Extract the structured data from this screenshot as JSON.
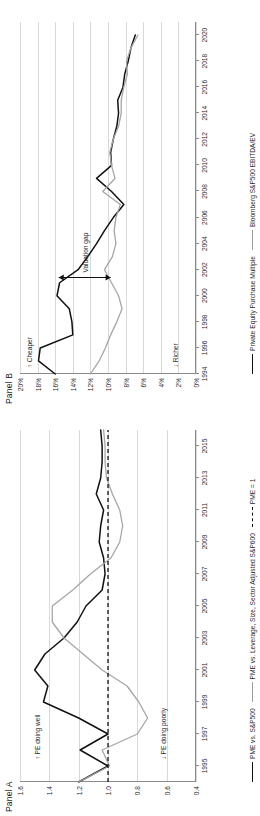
{
  "figure": {
    "orientation_degrees": -90,
    "background": "#ffffff"
  },
  "panels": [
    {
      "id": "A",
      "title": "Panel A",
      "notes": [
        {
          "name": "pe-doing-well",
          "text": "↑ PE doing well"
        },
        {
          "name": "pe-doing-poorly",
          "text": "↓ PE doing poorly"
        }
      ],
      "legend": [
        {
          "label": "PME vs. S&P500",
          "style": "solid-dark",
          "color": "#111111"
        },
        {
          "label": "PME vs. Leverage, Size, Sector Adjusted S&P600",
          "style": "solid-grey",
          "color": "#a6a6a6"
        },
        {
          "label": "PME = 1",
          "style": "dashed",
          "color": "#111111"
        }
      ],
      "chart_data": {
        "type": "line",
        "title": "Panel A",
        "xlabel": "",
        "ylabel": "",
        "xlim": [
          1994,
          2016
        ],
        "ylim": [
          0.4,
          1.6
        ],
        "yticks": [
          "0.4",
          "0.6",
          "0.8",
          "1.0",
          "1.2",
          "1.4",
          "1.6"
        ],
        "ytick_values": [
          0.4,
          0.6,
          0.8,
          1.0,
          1.2,
          1.4,
          1.6
        ],
        "xticks": [
          "1995",
          "1997",
          "1999",
          "2001",
          "2003",
          "2005",
          "2007",
          "2009",
          "2011",
          "2013",
          "2015"
        ],
        "xtick_values": [
          1995,
          1997,
          1999,
          2001,
          2003,
          2005,
          2007,
          2009,
          2011,
          2013,
          2015
        ],
        "grid": true,
        "legend_position": "bottom",
        "x": [
          1994,
          1995,
          1996,
          1997,
          1998,
          1999,
          2000,
          2001,
          2002,
          2003,
          2004,
          2005,
          2006,
          2007,
          2008,
          2009,
          2010,
          2011,
          2012,
          2013,
          2014,
          2015,
          2016
        ],
        "series": [
          {
            "name": "PME vs. S&P500",
            "color": "#111111",
            "values": [
              1.2,
              1.0,
              1.19,
              1.0,
              1.2,
              1.44,
              1.41,
              1.5,
              1.43,
              1.3,
              1.21,
              1.15,
              1.04,
              1.02,
              1.03,
              1.06,
              1.05,
              1.03,
              1.08,
              1.05,
              1.04,
              1.04,
              1.05
            ]
          },
          {
            "name": "PME vs. Leverage, Size, Sector Adjusted S&P600",
            "color": "#a6a6a6",
            "values": [
              1.2,
              0.99,
              1.04,
              0.8,
              0.73,
              0.79,
              0.87,
              1.04,
              1.17,
              1.3,
              1.38,
              1.38,
              1.24,
              1.12,
              0.98,
              0.92,
              0.9,
              0.92,
              0.97,
              1.01,
              1.02,
              1.02,
              1.03
            ]
          },
          {
            "name": "PME = 1",
            "color": "#111111",
            "style": "dashed",
            "values": [
              1.0,
              1.0,
              1.0,
              1.0,
              1.0,
              1.0,
              1.0,
              1.0,
              1.0,
              1.0,
              1.0,
              1.0,
              1.0,
              1.0,
              1.0,
              1.0,
              1.0,
              1.0,
              1.0,
              1.0,
              1.0,
              1.0,
              1.0
            ]
          }
        ]
      }
    },
    {
      "id": "B",
      "title": "Panel B",
      "notes": [
        {
          "name": "cheaper",
          "text": "↑ Cheaper"
        },
        {
          "name": "richer",
          "text": "↓ Richer"
        },
        {
          "name": "valuation-gap",
          "text": "Valuation gap"
        }
      ],
      "legend": [
        {
          "label": "Private Equity Purchase Multiple",
          "style": "solid-dark",
          "color": "#111111"
        },
        {
          "label": "Bloomberg S&P500 EBITDA/EV",
          "style": "solid-grey",
          "color": "#a6a6a6"
        }
      ],
      "chart_data": {
        "type": "line",
        "title": "Panel B",
        "xlabel": "",
        "ylabel": "",
        "xlim": [
          1994,
          2021
        ],
        "ylim": [
          0,
          20
        ],
        "yticks": [
          "0%",
          "2%",
          "4%",
          "6%",
          "8%",
          "10%",
          "12%",
          "14%",
          "16%",
          "18%",
          "20%"
        ],
        "ytick_values": [
          0,
          2,
          4,
          6,
          8,
          10,
          12,
          14,
          16,
          18,
          20
        ],
        "xticks": [
          "1994",
          "1996",
          "1998",
          "2000",
          "2002",
          "2004",
          "2006",
          "2008",
          "2010",
          "2012",
          "2014",
          "2016",
          "2018",
          "2020"
        ],
        "xtick_values": [
          1994,
          1996,
          1998,
          2000,
          2002,
          2004,
          2006,
          2008,
          2010,
          2012,
          2014,
          2016,
          2018,
          2020
        ],
        "grid": true,
        "legend_position": "bottom",
        "x": [
          1994,
          1995,
          1996,
          1997,
          1998,
          1999,
          2000,
          2001,
          2002,
          2003,
          2004,
          2005,
          2006,
          2007,
          2008,
          2009,
          2010,
          2011,
          2012,
          2013,
          2014,
          2015,
          2016,
          2017,
          2018,
          2019,
          2020
        ],
        "series": [
          {
            "name": "Private Equity Purchase Multiple",
            "color": "#111111",
            "values": [
              16.0,
              17.9,
              17.7,
              14.0,
              14.1,
              14.4,
              15.8,
              15.5,
              13.4,
              12.3,
              11.3,
              10.4,
              9.4,
              8.2,
              9.6,
              11.3,
              9.6,
              9.7,
              9.4,
              9.0,
              8.8,
              8.9,
              8.3,
              8.1,
              7.7,
              7.4,
              6.9
            ]
          },
          {
            "name": "Bloomberg S&P500 EBITDA/EV",
            "color": "#a6a6a6",
            "values": [
              12.0,
              11.0,
              10.3,
              9.7,
              9.0,
              8.4,
              8.8,
              9.6,
              10.4,
              9.5,
              9.1,
              9.3,
              9.1,
              8.6,
              10.6,
              9.2,
              9.6,
              9.8,
              9.4,
              8.8,
              8.5,
              8.5,
              8.2,
              7.8,
              7.9,
              7.4,
              6.6
            ]
          }
        ],
        "annotations": [
          {
            "name": "valuation-gap-arrow",
            "text": "Valuation gap",
            "x": 2001.4,
            "y_from": 9.7,
            "y_to": 15.6
          }
        ]
      }
    }
  ]
}
